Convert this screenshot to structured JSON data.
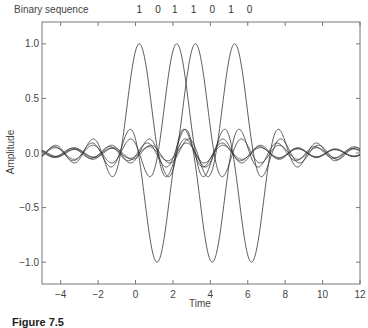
{
  "chart_data": {
    "type": "line",
    "title": "",
    "xlabel": "Time",
    "ylabel": "Amplitude",
    "xlim": [
      -5,
      12
    ],
    "ylim": [
      -1.2,
      1.2
    ],
    "xticks": [
      -4,
      -2,
      0,
      2,
      4,
      6,
      8,
      10,
      12
    ],
    "xtick_labels": [
      "−4",
      "−2",
      "0",
      "2",
      "4",
      "6",
      "8",
      "10",
      "12"
    ],
    "yticks": [
      1.0,
      0.5,
      0.0,
      -0.5,
      -1.0
    ],
    "ytick_labels": [
      "1.0",
      "0.5",
      "0.0",
      "−0.5",
      "−1.0"
    ],
    "grid": false,
    "sequence_label": "Binary sequence",
    "bits": [
      1,
      0,
      1,
      1,
      0,
      1,
      0
    ],
    "bit_times": [
      0.2,
      1.2,
      2.1,
      3.1,
      4.1,
      5.1,
      6.1
    ],
    "pulse_shape": "sinc",
    "series": [
      {
        "name": "pulse-bit-1",
        "bit": 1,
        "center": 0.2,
        "amplitude": 1
      },
      {
        "name": "pulse-bit-2",
        "bit": 0,
        "center": 1.15,
        "amplitude": -1
      },
      {
        "name": "pulse-bit-3",
        "bit": 1,
        "center": 2.2,
        "amplitude": 1
      },
      {
        "name": "pulse-bit-4",
        "bit": 1,
        "center": 3.2,
        "amplitude": 1
      },
      {
        "name": "pulse-bit-5",
        "bit": 0,
        "center": 4.1,
        "amplitude": -1
      },
      {
        "name": "pulse-bit-6",
        "bit": 1,
        "center": 5.3,
        "amplitude": 1
      },
      {
        "name": "pulse-bit-7",
        "bit": 0,
        "center": 6.2,
        "amplitude": -1
      }
    ],
    "line_color": "#333333"
  },
  "caption": {
    "label": "Figure 7.5",
    "text": ""
  }
}
